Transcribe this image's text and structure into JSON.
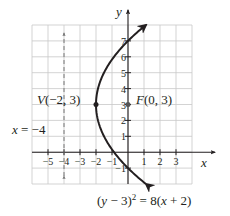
{
  "chart_data": {
    "type": "line",
    "title": "",
    "xlabel": "x",
    "ylabel": "y",
    "xlim": [
      -6,
      4
    ],
    "ylim": [
      -2,
      8
    ],
    "grid": true,
    "x_ticks": [
      -5,
      -4,
      -3,
      -2,
      -1,
      1,
      2,
      3
    ],
    "x_tick_labels": [
      "−5",
      "−4",
      "−3",
      "−2",
      "−1",
      "1",
      "2",
      "3"
    ],
    "y_ticks": [
      -1,
      1,
      2,
      3,
      4,
      5,
      6,
      7
    ],
    "y_tick_labels": [
      "−1",
      "1",
      "2",
      "3",
      "4",
      "5",
      "6",
      "7"
    ],
    "series": [
      {
        "name": "parabola",
        "equation": "(y − 3)² = 8(x + 2)",
        "style": "solid",
        "arrows": "both",
        "points": [
          {
            "x": 1.125,
            "y": -2
          },
          {
            "x": 0,
            "y": -1
          },
          {
            "x": -0.875,
            "y": 0
          },
          {
            "x": -1.5,
            "y": 1
          },
          {
            "x": -1.875,
            "y": 2
          },
          {
            "x": -2,
            "y": 3
          },
          {
            "x": -1.875,
            "y": 4
          },
          {
            "x": -1.5,
            "y": 5
          },
          {
            "x": -0.875,
            "y": 6
          },
          {
            "x": 0,
            "y": 7
          },
          {
            "x": 1.125,
            "y": 8
          }
        ]
      },
      {
        "name": "directrix",
        "equation": "x = −4",
        "style": "dashed",
        "arrows": "both",
        "points": [
          {
            "x": -4,
            "y": -1.5
          },
          {
            "x": -4,
            "y": 7.5
          }
        ]
      }
    ],
    "annotations": [
      {
        "label": "V(−2, 3)",
        "x": -2,
        "y": 3,
        "marker": "dot"
      },
      {
        "label": "F(0, 3)",
        "x": 0,
        "y": 3,
        "marker": "dot"
      },
      {
        "label": "x = −4",
        "x": -4,
        "y": 1.5
      },
      {
        "label": "(y − 3)² = 8(x + 2)",
        "x": 1,
        "y": -2.5
      }
    ]
  },
  "labels": {
    "x_axis": "x",
    "y_axis": "y",
    "vertex": "V(−2, 3)",
    "focus": "F(0, 3)",
    "directrix": "x = −4",
    "equation_lhs": "(y − 3)",
    "equation_exp": "2",
    "equation_rhs": " = 8(x + 2)"
  }
}
